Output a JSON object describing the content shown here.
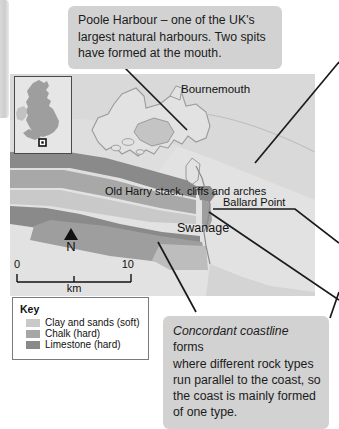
{
  "figure": {
    "kind": "geography-textbook-map",
    "region": "Dorset / Isle of Purbeck coast"
  },
  "callouts": [
    {
      "id": "poole-harbour",
      "lines": [
        "Poole Harbour – one of the UK's",
        "largest natural harbours. Two spits",
        "have formed at the mouth."
      ]
    },
    {
      "id": "concordant-coastline",
      "emphasis": "Concordant coastline",
      "lines": [
        " forms",
        "where different rock types",
        "run parallel to the coast, so",
        "the coast is mainly formed",
        "of one type."
      ]
    }
  ],
  "map_labels": {
    "bournemouth": "Bournemouth",
    "ballard_point": "Ballard Point",
    "swanage": "Swanage",
    "old_harry": [
      "Old Harry stack,",
      "cliffs and arches"
    ]
  },
  "north_arrow": {
    "label": "N"
  },
  "scale_bar": {
    "min": "0",
    "max": "10",
    "unit": "km"
  },
  "key": {
    "title": "Key",
    "items": [
      {
        "label": "Clay and sands (soft)",
        "color": "#c9c9c9"
      },
      {
        "label": "Chalk (hard)",
        "color": "#a6a6a6"
      },
      {
        "label": "Limestone (hard)",
        "color": "#8a8a8a"
      }
    ]
  },
  "colors": {
    "map_background": "#d9d9d9",
    "sea": "#d9d9d9",
    "land_light": "#e0e0e0",
    "clay_sands": "#c9c9c9",
    "chalk": "#a6a6a6",
    "limestone": "#8a8a8a",
    "callout_bg": "#d2d2d2",
    "leader_line": "#1a1a1a",
    "page": "#ffffff"
  }
}
